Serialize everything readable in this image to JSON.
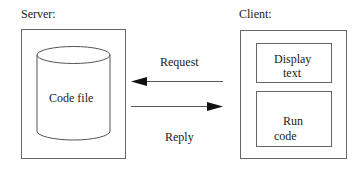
{
  "diagram": {
    "server": {
      "label": "Server:",
      "storage": {
        "label": "Code file",
        "shape": "cylinder"
      }
    },
    "client": {
      "label": "Client:",
      "panels": [
        {
          "line1": "Display",
          "line2": "text"
        },
        {
          "line1": "Run",
          "line2": "code"
        }
      ]
    },
    "arrows": [
      {
        "label": "Request",
        "direction": "client-to-server"
      },
      {
        "label": "Reply",
        "direction": "server-to-client"
      }
    ],
    "colors": {
      "stroke": "#555555",
      "text": "#222222",
      "background": "#ffffff"
    }
  }
}
